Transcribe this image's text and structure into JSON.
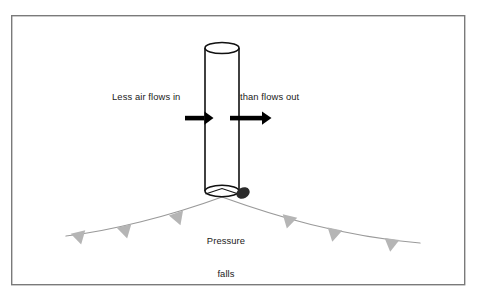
{
  "figure": {
    "type": "schematic-diagram",
    "canvas": {
      "width": 481,
      "height": 295
    },
    "frame": {
      "name": "figure-border",
      "x": 11,
      "y": 15,
      "width": 454,
      "height": 270,
      "stroke_color": "#7a7a7a",
      "fill_color": "#ffffff",
      "stroke_width": 1.4
    },
    "background_color": "#ffffff"
  },
  "labels": {
    "inflow": "Less air flows in",
    "outflow": "than flows out",
    "pressure_line_1": "Pressure",
    "pressure_line_2": "falls",
    "text_color": "#1a1a1a"
  },
  "column": {
    "name": "air-column-cylinder",
    "left_x": 205,
    "right_x": 239,
    "top_y": 48,
    "bottom_y": 191,
    "ellipse_rx": 17,
    "ellipse_ry": 5.5,
    "stroke_color": "#111111",
    "fill_color": "#ffffff",
    "stroke_width": 1.6
  },
  "arrows": {
    "stroke_color": "#000000",
    "inflow_arrow": {
      "name": "inflow-arrow",
      "x1": 185,
      "x2": 213,
      "y": 118,
      "shaft_width": 4.5,
      "head_length": 9,
      "head_width": 13
    },
    "outflow_arrow": {
      "name": "outflow-arrow",
      "x1": 230,
      "x2": 271,
      "y": 118,
      "shaft_width": 4.5,
      "head_length": 9,
      "head_width": 13
    }
  },
  "front": {
    "name": "surface-front-curve",
    "stroke_color": "#9a9a9a",
    "stroke_width": 1.2,
    "apex": {
      "x": 222,
      "y": 197
    },
    "left_end": {
      "x": 66,
      "y": 236
    },
    "right_end": {
      "x": 420,
      "y": 243
    },
    "triangle_color": "#b5b5b5",
    "triangle_width": 15,
    "triangle_height": 13,
    "triangles_left": [
      {
        "x": 78,
        "y": 232,
        "rotation": -14
      },
      {
        "x": 124,
        "y": 226,
        "rotation": -14
      },
      {
        "x": 176,
        "y": 213,
        "rotation": -20
      }
    ],
    "triangles_right": [
      {
        "x": 290,
        "y": 216,
        "rotation": 14
      },
      {
        "x": 335,
        "y": 229,
        "rotation": 12
      },
      {
        "x": 392,
        "y": 239,
        "rotation": 8
      }
    ]
  },
  "blob": {
    "name": "surface-marker-blob",
    "cx": 243,
    "cy": 193,
    "rx": 7,
    "ry": 5.5,
    "rotation": -28,
    "fill_color": "#2b2b2b"
  }
}
